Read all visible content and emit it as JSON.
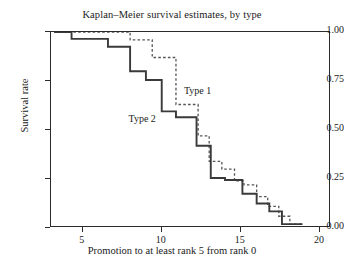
{
  "chart_data": {
    "type": "line",
    "title": "Kaplan–Meier survival estimates, by type",
    "xlabel": "Promotion to at least rank 5 from rank 0",
    "ylabel": "Survival rate",
    "xlim": [
      3.0,
      20.7
    ],
    "ylim": [
      0.0,
      1.0
    ],
    "grid": false,
    "legend_position": "inline-annotation",
    "xticks": [
      5,
      10,
      15,
      20
    ],
    "xtick_labels": [
      "5",
      "10",
      "15",
      "20"
    ],
    "yticks": [
      0.0,
      0.25,
      0.5,
      0.75,
      1.0
    ],
    "ytick_labels": [
      "0.00",
      "0.25",
      "0.50",
      "0.75",
      "1.00"
    ],
    "series": [
      {
        "name": "Type 1",
        "style": "dashed",
        "color": "#555555",
        "annotation": "Type 1",
        "annotation_x": 11.4,
        "annotation_y": 0.7,
        "x": [
          3.2,
          8.0,
          8.0,
          9.4,
          9.4,
          10.9,
          10.9,
          12.3,
          12.3,
          13.0,
          13.0,
          13.8,
          13.8,
          14.6,
          14.6,
          15.2,
          15.2,
          16.0,
          16.0,
          16.7,
          16.7,
          17.4,
          17.4,
          18.1,
          18.1,
          18.9
        ],
        "y": [
          1.0,
          1.0,
          0.96,
          0.96,
          0.87,
          0.87,
          0.63,
          0.63,
          0.47,
          0.47,
          0.34,
          0.34,
          0.3,
          0.3,
          0.24,
          0.24,
          0.22,
          0.22,
          0.16,
          0.16,
          0.11,
          0.11,
          0.06,
          0.06,
          0.02,
          0.02
        ]
      },
      {
        "name": "Type 2",
        "style": "solid",
        "color": "#3a3a3a",
        "annotation": "Type 2",
        "annotation_x": 7.9,
        "annotation_y": 0.555,
        "x": [
          3.2,
          4.3,
          4.3,
          6.6,
          6.6,
          8.0,
          8.0,
          9.0,
          9.0,
          10.0,
          10.0,
          10.9,
          10.9,
          12.2,
          12.2,
          13.1,
          13.1,
          14.0,
          14.0,
          15.1,
          15.1,
          16.0,
          16.0,
          16.8,
          16.8,
          17.6,
          17.6,
          18.9
        ],
        "y": [
          1.0,
          1.0,
          0.965,
          0.965,
          0.925,
          0.925,
          0.8,
          0.8,
          0.755,
          0.755,
          0.595,
          0.595,
          0.565,
          0.565,
          0.42,
          0.42,
          0.255,
          0.255,
          0.245,
          0.245,
          0.175,
          0.175,
          0.125,
          0.125,
          0.085,
          0.085,
          0.02,
          0.02
        ]
      }
    ]
  }
}
